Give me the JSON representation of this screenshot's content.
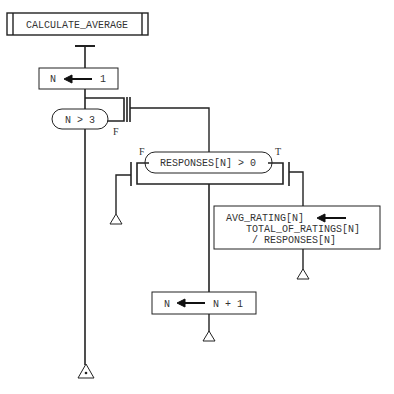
{
  "diagram": {
    "title": "CALCULATE_AVERAGE",
    "init": {
      "lhs": "N",
      "rhs": "1"
    },
    "loop_condition": {
      "text": "N > 3",
      "exit_label": "F"
    },
    "branch": {
      "condition": "RESPONSES[N] > 0",
      "false_label": "F",
      "true_label": "T"
    },
    "assign_avg": {
      "lhs": "AVG_RATING[N]",
      "rhs_line1": "TOTAL_OF_RATINGS[N]",
      "rhs_line2": "/ RESPONSES[N]"
    },
    "increment": {
      "lhs": "N",
      "rhs": "N + 1"
    },
    "colors": {
      "line": "#222222",
      "text": "#333333",
      "background": "#ffffff"
    }
  }
}
